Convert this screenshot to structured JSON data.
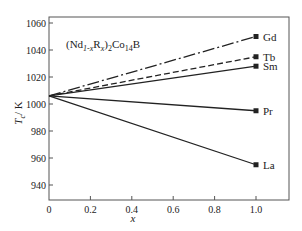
{
  "chart_data": {
    "type": "line",
    "title": "(Nd1-xRx)2Co14B",
    "title_parts": {
      "open": "(Nd",
      "sub1": "1-x",
      "mid": "R",
      "sub2": "x",
      "close": ")",
      "sub3": "2",
      "tail": "Co",
      "sub4": "14",
      "end": "B"
    },
    "xlabel": "x",
    "ylabel_main": "T",
    "ylabel_sub": "c",
    "ylabel_unit": "/ K",
    "xlim": [
      0,
      1.15
    ],
    "ylim": [
      930,
      1062
    ],
    "xticks": [
      0,
      0.2,
      0.4,
      0.6,
      0.8,
      1.0
    ],
    "xtick_labels": [
      "0",
      "0.2",
      "0.4",
      "0.6",
      "0.8",
      "1.0"
    ],
    "yticks": [
      940,
      960,
      980,
      1000,
      1020,
      1040,
      1060
    ],
    "ytick_labels": [
      "940",
      "960",
      "980",
      "1000",
      "1020",
      "1040",
      "1060"
    ],
    "grid": false,
    "legend": "direct labels at right end of each line",
    "series": [
      {
        "name": "Gd",
        "x": [
          0,
          1.0
        ],
        "y": [
          1006,
          1050
        ],
        "style": "dash-dot"
      },
      {
        "name": "Tb",
        "x": [
          0,
          1.0
        ],
        "y": [
          1006,
          1035
        ],
        "style": "dashed"
      },
      {
        "name": "Sm",
        "x": [
          0,
          1.0
        ],
        "y": [
          1006,
          1028
        ],
        "style": "solid"
      },
      {
        "name": "Pr",
        "x": [
          0,
          1.0
        ],
        "y": [
          1006,
          995
        ],
        "style": "solid"
      },
      {
        "name": "La",
        "x": [
          0,
          1.0
        ],
        "y": [
          1006,
          955
        ],
        "style": "solid"
      }
    ],
    "line_color": "#222222"
  }
}
